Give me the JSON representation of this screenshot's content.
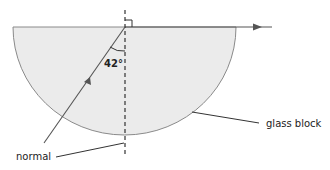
{
  "diagram": {
    "type": "refraction",
    "angle_label": "42°",
    "labels": {
      "normal": "normal",
      "glass_block": "glass block"
    },
    "colors": {
      "block_fill": "#ebebeb",
      "block_edge": "#8a8a8a",
      "ray": "#555555",
      "text": "#222222"
    }
  }
}
